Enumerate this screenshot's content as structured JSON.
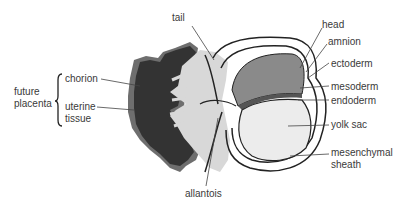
{
  "diagram": {
    "type": "embryo cross-section",
    "labels": {
      "tail": "tail",
      "head": "head",
      "amnion": "amnion",
      "ectoderm": "ectoderm",
      "mesoderm": "mesoderm",
      "endoderm": "endoderm",
      "yolk_sac": "yolk sac",
      "mesenchymal_1": "mesenchymal",
      "mesenchymal_2": "sheath",
      "allantois": "allantois",
      "chorion": "chorion",
      "uterine_1": "uterine",
      "uterine_2": "tissue",
      "future_1": "future",
      "future_2": "placenta"
    },
    "colors": {
      "uterine_dark": "#3a3a3a",
      "uterine_edge": "#6e6e6e",
      "chorion_light": "#d6d6d6",
      "embryo_dark": "#7a7a7a",
      "yolk": "#ececec",
      "outline": "#222222"
    }
  }
}
